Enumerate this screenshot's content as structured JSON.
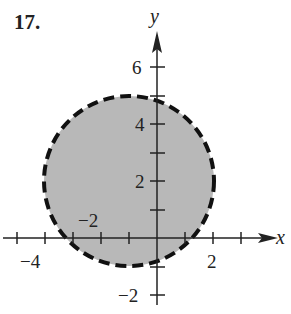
{
  "problem_number": "17.",
  "axes": {
    "x_label": "x",
    "y_label": "y"
  },
  "tick_labels": {
    "x": [
      {
        "value": -4,
        "text": "−4"
      },
      {
        "value": -2,
        "text": "−2"
      },
      {
        "value": 2,
        "text": "2"
      }
    ],
    "y": [
      {
        "value": 6,
        "text": "6"
      },
      {
        "value": 4,
        "text": "4"
      },
      {
        "value": 2,
        "text": "2"
      },
      {
        "value": -2,
        "text": "−2"
      }
    ]
  },
  "region": {
    "shape": "disk",
    "center": [
      -1,
      2
    ],
    "radius": 3,
    "boundary": "dashed",
    "fill_color": "#b8b8b8",
    "boundary_color": "#111111"
  }
}
